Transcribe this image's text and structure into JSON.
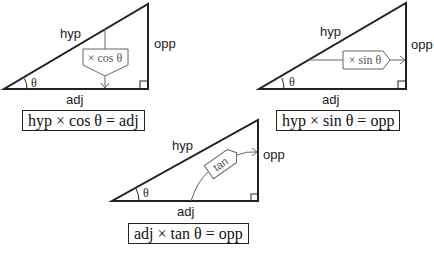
{
  "diagrams": [
    {
      "id": "cosine",
      "labels": {
        "hyp": "hyp",
        "opp": "opp",
        "adj": "adj",
        "angle": "θ"
      },
      "operation": "× cos θ",
      "formula": "hyp × cos θ = adj"
    },
    {
      "id": "sine",
      "labels": {
        "hyp": "hyp",
        "opp": "opp",
        "adj": "adj",
        "angle": "θ"
      },
      "operation": "× sin θ",
      "formula": "hyp × sin θ = opp"
    },
    {
      "id": "tangent",
      "labels": {
        "hyp": "hyp",
        "opp": "opp",
        "adj": "adj",
        "angle": "θ"
      },
      "operation": "tan",
      "formula": "adj × tan θ = opp"
    }
  ],
  "colors": {
    "line": "#222222",
    "muted": "#666666",
    "background": "#ffffff"
  }
}
